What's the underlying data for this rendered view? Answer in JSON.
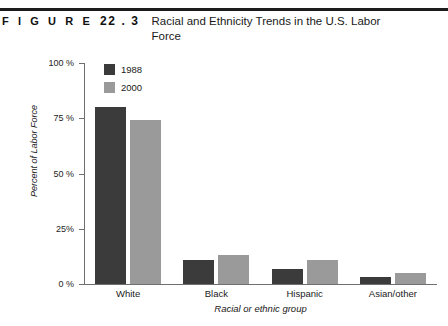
{
  "figure": {
    "word": "F I G U R E",
    "number": "22 . 3",
    "title": "Racial and Ethnicity Trends in the U.S. Labor Force"
  },
  "legend": {
    "items": [
      {
        "label": "1988",
        "color": "#3b3b3b"
      },
      {
        "label": "2000",
        "color": "#9a9a9a"
      }
    ]
  },
  "axis": {
    "y_ticks": [
      "100 %",
      "75 %",
      "50 %",
      "25%",
      "0 %"
    ],
    "y_title": "Percent of Labor Force",
    "x_title": "Racial or ethnic group"
  },
  "chart_data": {
    "type": "bar",
    "title": "Racial and Ethnicity Trends in the U.S. Labor Force",
    "xlabel": "Racial or ethnic group",
    "ylabel": "Percent of Labor Force",
    "ylim": [
      0,
      100
    ],
    "ytick_values": [
      0,
      25,
      50,
      75,
      100
    ],
    "ytick_labels": [
      "0 %",
      "25%",
      "50 %",
      "75 %",
      "100 %"
    ],
    "grid": false,
    "legend_position": "top-left inside plot",
    "categories": [
      "White",
      "Black",
      "Hispanic",
      "Asian/other"
    ],
    "series": [
      {
        "name": "1988",
        "color": "#3b3b3b",
        "values": [
          80,
          11,
          7,
          3
        ]
      },
      {
        "name": "2000",
        "color": "#9a9a9a",
        "values": [
          74,
          13,
          11,
          5
        ]
      }
    ]
  }
}
